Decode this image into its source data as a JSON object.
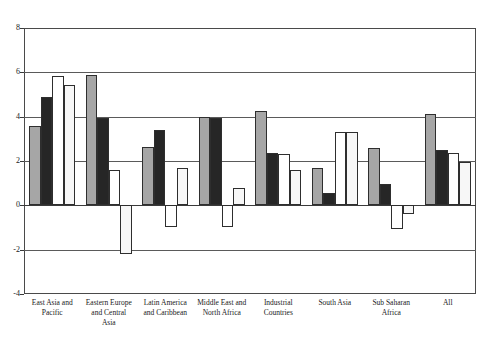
{
  "chart_data": {
    "type": "bar",
    "title": "",
    "subtitle": "",
    "xlabel": "",
    "ylabel": "",
    "ylim": [
      -4,
      8
    ],
    "yticks": [
      8,
      6,
      4,
      2,
      0,
      -2,
      -4
    ],
    "ytick_labels": [
      "8",
      "6",
      "4",
      "2",
      "0",
      "-2",
      "-4"
    ],
    "grid": true,
    "legend": "none",
    "orientation": "vertical",
    "grouping": "clustered",
    "categories": [
      "East Asia and Pacific",
      "Eastern Europe and Central Asia",
      "Latin America and Caribbean",
      "Middle East and North Africa",
      "Industrial Countries",
      "South Asia",
      "Sub Saharan Africa",
      "All"
    ],
    "category_lines": [
      [
        "East Asia and",
        "Pacific"
      ],
      [
        "Eastern Europe",
        "and Central",
        "Asia"
      ],
      [
        "Latin America",
        "and Caribbean"
      ],
      [
        "Middle East and",
        "North Africa"
      ],
      [
        "Industrial",
        "Countries"
      ],
      [
        "South Asia"
      ],
      [
        "Sub Saharan",
        "Africa"
      ],
      [
        "All"
      ]
    ],
    "series": [
      {
        "name": "series-1",
        "fill": "#a6a6a6",
        "values": [
          3.6,
          5.9,
          2.65,
          4.0,
          4.25,
          1.7,
          2.6,
          4.1
        ]
      },
      {
        "name": "series-2",
        "fill": "#262626",
        "values": [
          4.9,
          3.95,
          3.4,
          3.95,
          2.35,
          0.55,
          0.95,
          2.5
        ]
      },
      {
        "name": "series-3",
        "fill": "#ffffff",
        "values": [
          5.85,
          1.6,
          -1.0,
          -1.0,
          2.3,
          3.3,
          -1.05,
          2.35
        ]
      },
      {
        "name": "series-4",
        "fill": "#f7f7f7",
        "values": [
          5.45,
          -2.2,
          1.7,
          0.8,
          1.6,
          3.3,
          -0.4,
          1.95
        ]
      }
    ]
  },
  "axis": {
    "zero_label": "0"
  }
}
